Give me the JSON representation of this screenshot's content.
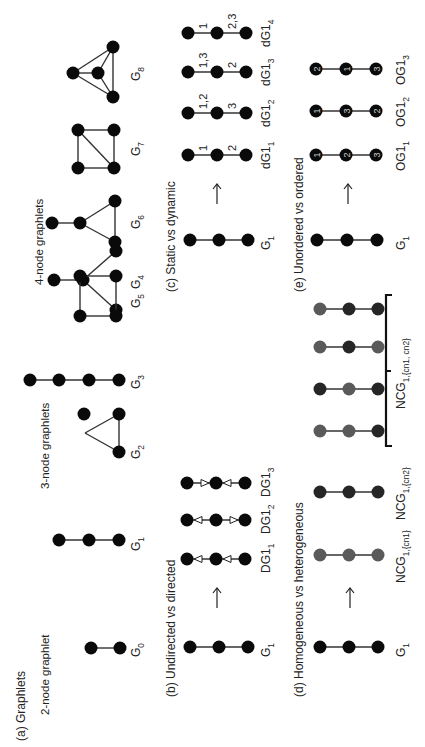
{
  "figure": {
    "orientation": "rotated -90deg (text reads bottom-to-top)",
    "colors": {
      "node_black": "#0a0a0a",
      "node_gray": "#5a5a5a",
      "node_dark": "#262626",
      "edge": "#333333",
      "text": "#222222"
    }
  },
  "panels": {
    "a": {
      "title": "(a) Graphlets",
      "group_labels": [
        "2-node graphlet",
        "3-node graphlets",
        "4-node graphlets"
      ],
      "graphlets": [
        {
          "name": "G",
          "sub": "0"
        },
        {
          "name": "G",
          "sub": "1"
        },
        {
          "name": "G",
          "sub": "2"
        },
        {
          "name": "G",
          "sub": "3"
        },
        {
          "name": "G",
          "sub": "4"
        },
        {
          "name": "G",
          "sub": "5"
        },
        {
          "name": "G",
          "sub": "6"
        },
        {
          "name": "G",
          "sub": "7"
        },
        {
          "name": "G",
          "sub": "8"
        }
      ]
    },
    "b": {
      "title": "(b) Undirected vs directed",
      "source": {
        "name": "G",
        "sub": "1"
      },
      "arrow": "→",
      "variants": [
        {
          "name": "DG1",
          "sub": "1",
          "edge1": "toward-first",
          "edge2": "toward-first"
        },
        {
          "name": "DG1",
          "sub": "2",
          "edge1": "toward-first",
          "edge2": "toward-last"
        },
        {
          "name": "DG1",
          "sub": "3",
          "edge1": "toward-middle",
          "edge2": "toward-middle"
        }
      ]
    },
    "c": {
      "title": "(c) Static vs dynamic",
      "source": {
        "name": "G",
        "sub": "1"
      },
      "arrow": "→",
      "variants": [
        {
          "name": "dG1",
          "sub": "1",
          "edge1_label": "1",
          "edge2_label": "2"
        },
        {
          "name": "dG1",
          "sub": "2",
          "edge1_label": "1,2",
          "edge2_label": "3"
        },
        {
          "name": "dG1",
          "sub": "3",
          "edge1_label": "1,3",
          "edge2_label": "2"
        },
        {
          "name": "dG1",
          "sub": "4",
          "edge1_label": "1",
          "edge2_label": "2,3"
        }
      ]
    },
    "d": {
      "title": "(d) Homogeneous vs heterogeneous",
      "source": {
        "name": "G",
        "sub": "1"
      },
      "arrow": "→",
      "variants": [
        {
          "name": "NCG",
          "sub": "1,{cn1}",
          "nodes": [
            "gray",
            "gray",
            "gray"
          ]
        },
        {
          "name": "NCG",
          "sub": "1,{cn2}",
          "nodes": [
            "dark",
            "dark",
            "dark"
          ]
        },
        {
          "name": "",
          "sub": "",
          "nodes": [
            "gray",
            "gray",
            "dark"
          ]
        },
        {
          "name": "",
          "sub": "",
          "nodes": [
            "dark",
            "gray",
            "dark"
          ]
        },
        {
          "name": "",
          "sub": "",
          "nodes": [
            "gray",
            "dark",
            "gray"
          ]
        },
        {
          "name": "",
          "sub": "",
          "nodes": [
            "gray",
            "dark",
            "dark"
          ]
        }
      ],
      "bracket_label": {
        "name": "NCG",
        "sub": "1,{cn1, cn2}"
      }
    },
    "e": {
      "title": "(e) Unordered vs ordered",
      "source": {
        "name": "G",
        "sub": "1"
      },
      "arrow": "→",
      "variants": [
        {
          "name": "OG1",
          "sub": "1",
          "orders": [
            "1",
            "2",
            "3"
          ]
        },
        {
          "name": "OG1",
          "sub": "2",
          "orders": [
            "1",
            "3",
            "2"
          ]
        },
        {
          "name": "OG1",
          "sub": "3",
          "orders": [
            "2",
            "1",
            "3"
          ]
        }
      ]
    }
  }
}
